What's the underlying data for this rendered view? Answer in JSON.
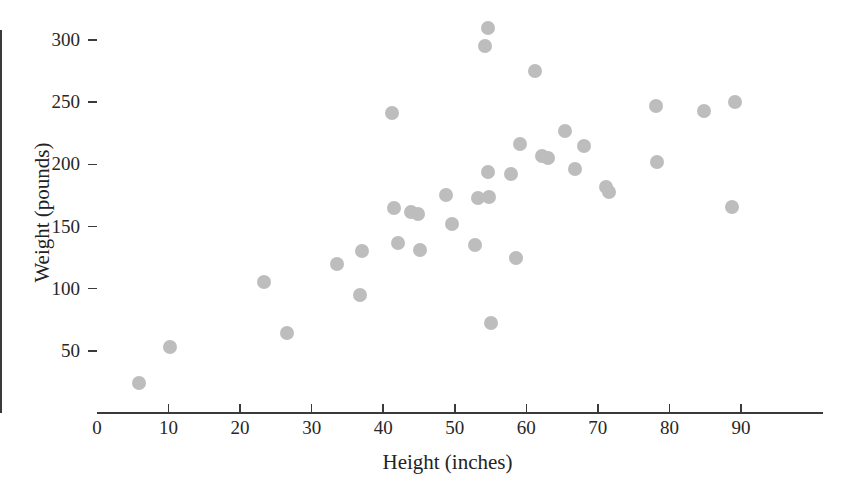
{
  "chart_data": {
    "type": "scatter",
    "title": "",
    "xlabel": "Height (inches)",
    "ylabel": "Weight (pounds)",
    "xlim": [
      0,
      101
    ],
    "ylim": [
      0,
      330
    ],
    "grid": false,
    "legend": "none",
    "marker": {
      "shape": "circle",
      "color": "#bdbdbd",
      "size_px": 14
    },
    "x_ticks": [
      0,
      10,
      20,
      30,
      40,
      50,
      60,
      70,
      80,
      90
    ],
    "x_tick_labels": [
      "0",
      "10",
      "20",
      "30",
      "40",
      "50",
      "60",
      "70",
      "80",
      "90"
    ],
    "y_ticks": [
      50,
      100,
      150,
      200,
      250,
      300
    ],
    "y_tick_labels": [
      "50",
      "100",
      "150",
      "200",
      "250",
      "300"
    ],
    "x": [
      5.9,
      10.2,
      23.4,
      26.5,
      33.6,
      36.8,
      37.1,
      41.2,
      41.5,
      42.1,
      43.9,
      44.9,
      45.2,
      48.8,
      49.6,
      52.9,
      53.3,
      54.2,
      54.6,
      54.7,
      54.8,
      55.1,
      57.9,
      58.6,
      59.1,
      61.2,
      62.2,
      63.1,
      65.4,
      66.8,
      68.1,
      71.1,
      71.6,
      78.1,
      78.3,
      84.9,
      88.8,
      89.1
    ],
    "y": [
      24,
      53,
      105,
      64,
      120,
      95,
      130,
      241,
      165,
      137,
      162,
      160,
      131,
      175,
      152,
      135,
      173,
      295,
      310,
      194,
      174,
      72,
      192,
      125,
      216,
      275,
      207,
      205,
      227,
      196,
      215,
      182,
      178,
      247,
      202,
      243,
      166,
      250
    ],
    "points": [
      {
        "x": 5.9,
        "y": 24
      },
      {
        "x": 10.2,
        "y": 53
      },
      {
        "x": 23.4,
        "y": 105
      },
      {
        "x": 26.5,
        "y": 64
      },
      {
        "x": 33.6,
        "y": 120
      },
      {
        "x": 36.8,
        "y": 95
      },
      {
        "x": 37.1,
        "y": 130
      },
      {
        "x": 41.2,
        "y": 241
      },
      {
        "x": 41.5,
        "y": 165
      },
      {
        "x": 42.1,
        "y": 137
      },
      {
        "x": 43.9,
        "y": 162
      },
      {
        "x": 44.9,
        "y": 160
      },
      {
        "x": 45.2,
        "y": 131
      },
      {
        "x": 48.8,
        "y": 175
      },
      {
        "x": 49.6,
        "y": 152
      },
      {
        "x": 52.9,
        "y": 135
      },
      {
        "x": 53.3,
        "y": 173
      },
      {
        "x": 54.2,
        "y": 295
      },
      {
        "x": 54.6,
        "y": 310
      },
      {
        "x": 54.7,
        "y": 194
      },
      {
        "x": 54.8,
        "y": 174
      },
      {
        "x": 55.1,
        "y": 72
      },
      {
        "x": 57.9,
        "y": 192
      },
      {
        "x": 58.6,
        "y": 125
      },
      {
        "x": 59.1,
        "y": 216
      },
      {
        "x": 61.2,
        "y": 275
      },
      {
        "x": 62.2,
        "y": 207
      },
      {
        "x": 63.1,
        "y": 205
      },
      {
        "x": 65.4,
        "y": 227
      },
      {
        "x": 66.8,
        "y": 196
      },
      {
        "x": 68.1,
        "y": 215
      },
      {
        "x": 71.1,
        "y": 182
      },
      {
        "x": 71.6,
        "y": 178
      },
      {
        "x": 78.1,
        "y": 247
      },
      {
        "x": 78.3,
        "y": 202
      },
      {
        "x": 84.9,
        "y": 243
      },
      {
        "x": 88.8,
        "y": 166
      },
      {
        "x": 89.1,
        "y": 250
      }
    ]
  }
}
